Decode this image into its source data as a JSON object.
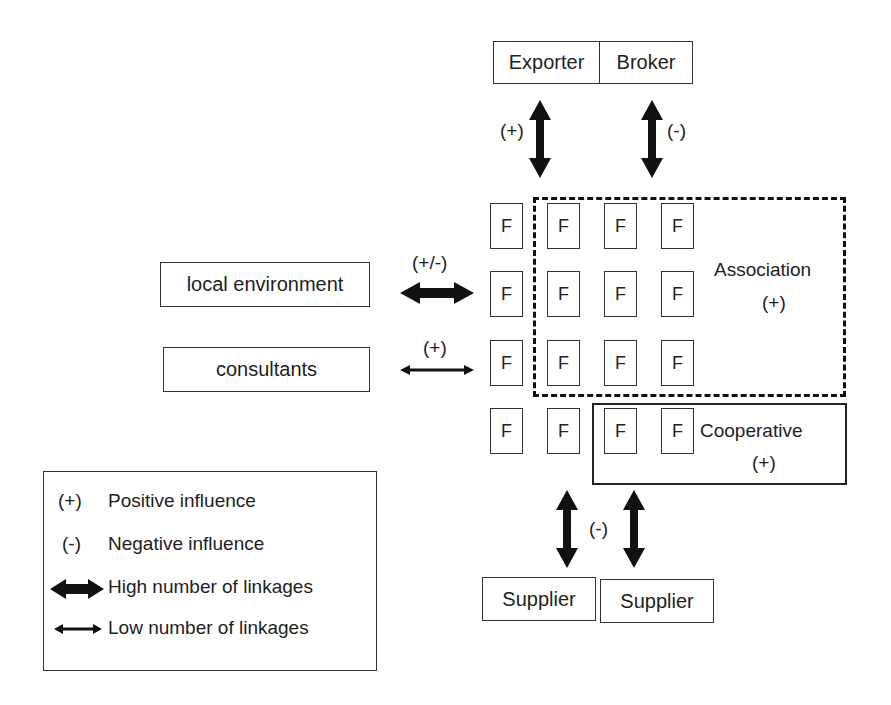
{
  "diagram": {
    "top_nodes": [
      {
        "label": "Exporter",
        "arrow_label": "(+)",
        "arrow_type": "high"
      },
      {
        "label": "Broker",
        "arrow_label": "(-)",
        "arrow_type": "high"
      }
    ],
    "left_nodes": [
      {
        "label": "local environment",
        "arrow_label": "(+/-)",
        "arrow_type": "high"
      },
      {
        "label": "consultants",
        "arrow_label": "(+)",
        "arrow_type": "low"
      }
    ],
    "bottom_nodes": [
      {
        "label": "Supplier"
      },
      {
        "label": "Supplier"
      }
    ],
    "bottom_arrow_label": "(-)",
    "firm_label": "F",
    "firm_grid": {
      "rows": 4,
      "cols": 4
    },
    "association": {
      "label": "Association",
      "sign": "(+)",
      "border": "dashed"
    },
    "cooperative": {
      "label": "Cooperative",
      "sign": "(+)",
      "border": "solid"
    }
  },
  "legend": {
    "items": [
      {
        "symbol": "(+)",
        "text": "Positive influence"
      },
      {
        "symbol": "(-)",
        "text": "Negative influence"
      },
      {
        "symbol": "thick-double-arrow",
        "text": "High number of linkages"
      },
      {
        "symbol": "thin-double-arrow",
        "text": "Low number of linkages"
      }
    ]
  }
}
